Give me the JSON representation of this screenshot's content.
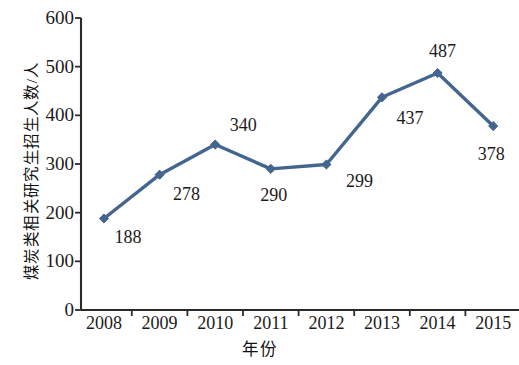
{
  "chart_data": {
    "type": "line",
    "title": "",
    "xlabel": "年份",
    "ylabel": "煤炭类相关研究生招生人数/人",
    "categories": [
      "2008",
      "2009",
      "2010",
      "2011",
      "2012",
      "2013",
      "2014",
      "2015"
    ],
    "values": [
      188,
      278,
      340,
      290,
      299,
      437,
      487,
      378
    ],
    "value_labels": [
      "188",
      "278",
      "340",
      "290",
      "299",
      "437",
      "487",
      "378"
    ],
    "ylim": [
      0,
      600
    ],
    "y_ticks": [
      "0",
      "100",
      "200",
      "300",
      "400",
      "500",
      "600"
    ],
    "grid": false,
    "legend": false,
    "series_color": "#44658e",
    "marker": "diamond",
    "axis_color": "#2b2b2b"
  },
  "axis": {
    "y_title": "煤炭类相关研究生招生人数/人",
    "x_title": "年份"
  }
}
